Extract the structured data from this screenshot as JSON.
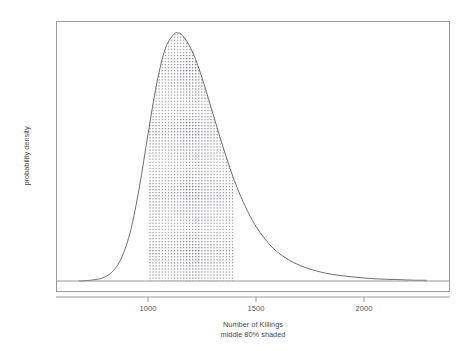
{
  "chart_data": {
    "type": "area",
    "title": "",
    "xlabel": "Number of Killings",
    "sublabel": "middle 80% shaded",
    "ylabel": "probability density",
    "xlim": [
      680,
      2290
    ],
    "ylim": [
      0,
      1
    ],
    "grid": false,
    "legend": "none",
    "xticks": [
      1000,
      1500,
      2000
    ],
    "xtick_labels": [
      "1000",
      "1500",
      "2000"
    ],
    "yticks": [],
    "ytick_labels": [],
    "distribution": {
      "shape": "right-skewed unimodal (lognormal-like)",
      "mode": 1140,
      "median": 1165,
      "scale": 150
    },
    "shaded_interval": {
      "label": "middle 80% shaded",
      "lower": 1000,
      "upper": 1400,
      "coverage_percent": 80,
      "fill_style": "dotted"
    },
    "x": [
      680,
      720,
      760,
      800,
      840,
      880,
      920,
      960,
      1000,
      1040,
      1080,
      1120,
      1140,
      1160,
      1200,
      1240,
      1280,
      1320,
      1360,
      1400,
      1440,
      1480,
      1520,
      1560,
      1600,
      1650,
      1700,
      1750,
      1800,
      1850,
      1900,
      1950,
      2000,
      2050,
      2100,
      2150,
      2200,
      2250,
      2290
    ],
    "density": [
      0.0,
      0.002,
      0.006,
      0.016,
      0.042,
      0.098,
      0.205,
      0.378,
      0.592,
      0.795,
      0.937,
      0.995,
      1.0,
      0.99,
      0.935,
      0.846,
      0.735,
      0.618,
      0.506,
      0.405,
      0.32,
      0.25,
      0.194,
      0.15,
      0.116,
      0.086,
      0.064,
      0.048,
      0.036,
      0.027,
      0.021,
      0.016,
      0.012,
      0.009,
      0.007,
      0.006,
      0.004,
      0.003,
      0.003
    ]
  },
  "colors": {
    "curve": "#5d5d5d",
    "frame": "#9a9a9a",
    "shade_dots": "#7d7d86",
    "text": "#4a4a4a",
    "background": "#ffffff"
  }
}
